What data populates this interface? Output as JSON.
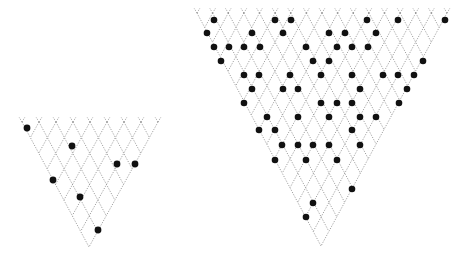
{
  "diagram": {
    "colors": {
      "background": "#ffffff",
      "lattice": "#8a8a8a",
      "dot": "#111111"
    },
    "triangles": [
      {
        "id": "small-triangle",
        "top_y": 122,
        "left_x": 22,
        "right_x": 158,
        "apex": [
          89,
          247
        ],
        "cols": 8,
        "dot_radius": 3.4,
        "dots": [
          [
            27,
            128
          ],
          [
            72,
            146
          ],
          [
            117,
            164
          ],
          [
            135,
            164
          ],
          [
            53,
            180
          ],
          [
            80,
            197
          ],
          [
            98,
            230
          ]
        ]
      },
      {
        "id": "large-triangle",
        "top_y": 13,
        "left_x": 197,
        "right_x": 447,
        "apex": [
          321,
          246
        ],
        "cols": 16,
        "dot_radius": 3.3,
        "dots": [
          [
            214,
            20
          ],
          [
            275,
            20
          ],
          [
            291,
            20
          ],
          [
            367,
            20
          ],
          [
            398,
            20
          ],
          [
            445,
            20
          ],
          [
            207,
            33
          ],
          [
            252,
            33
          ],
          [
            283,
            33
          ],
          [
            329,
            33
          ],
          [
            345,
            33
          ],
          [
            376,
            33
          ],
          [
            214,
            47
          ],
          [
            229,
            47
          ],
          [
            244,
            47
          ],
          [
            260,
            47
          ],
          [
            306,
            47
          ],
          [
            337,
            47
          ],
          [
            352,
            47
          ],
          [
            368,
            47
          ],
          [
            221,
            61
          ],
          [
            313,
            61
          ],
          [
            329,
            61
          ],
          [
            423,
            61
          ],
          [
            244,
            75
          ],
          [
            259,
            75
          ],
          [
            290,
            75
          ],
          [
            321,
            75
          ],
          [
            352,
            75
          ],
          [
            383,
            75
          ],
          [
            398,
            75
          ],
          [
            414,
            75
          ],
          [
            252,
            89
          ],
          [
            283,
            89
          ],
          [
            298,
            89
          ],
          [
            360,
            89
          ],
          [
            407,
            89
          ],
          [
            244,
            103
          ],
          [
            321,
            103
          ],
          [
            337,
            103
          ],
          [
            352,
            103
          ],
          [
            399,
            103
          ],
          [
            267,
            117
          ],
          [
            298,
            117
          ],
          [
            329,
            117
          ],
          [
            360,
            117
          ],
          [
            376,
            117
          ],
          [
            259,
            130
          ],
          [
            275,
            130
          ],
          [
            352,
            130
          ],
          [
            282,
            145
          ],
          [
            298,
            145
          ],
          [
            313,
            145
          ],
          [
            329,
            145
          ],
          [
            360,
            145
          ],
          [
            275,
            160
          ],
          [
            306,
            160
          ],
          [
            337,
            160
          ],
          [
            352,
            189
          ],
          [
            313,
            203
          ],
          [
            306,
            217
          ]
        ]
      }
    ]
  }
}
